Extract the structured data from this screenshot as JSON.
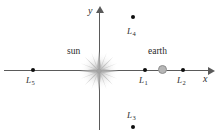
{
  "figure": {
    "type": "diagram",
    "background_color": "#ffffff"
  },
  "axes": {
    "x": {
      "label": "x",
      "orientation": "horizontal",
      "arrow": "right",
      "color": "#5a5a5a"
    },
    "y": {
      "label": "y",
      "orientation": "vertical",
      "arrow": "up",
      "color": "#5a5a5a"
    },
    "origin": {
      "x": 99,
      "y": 70
    }
  },
  "bodies": [
    {
      "name": "sun",
      "label": "sun",
      "icon": "sun-starburst-icon",
      "color": "#b9b9b9",
      "x": 99,
      "y": 70,
      "label_x": 67,
      "label_y": 47
    },
    {
      "name": "earth",
      "label": "earth",
      "icon": "earth-disc-icon",
      "color": "#b6b6b6",
      "x": 163,
      "y": 70,
      "label_x": 148,
      "label_y": 47
    }
  ],
  "lagrange_points": [
    {
      "id": "L1",
      "letter": "L",
      "subscript": "1",
      "x": 145,
      "y": 70,
      "label_x": 139,
      "label_y": 76,
      "color": "#0d0d0d"
    },
    {
      "id": "L2",
      "letter": "L",
      "subscript": "2",
      "x": 183,
      "y": 70,
      "label_x": 177,
      "label_y": 76,
      "color": "#0d0d0d"
    },
    {
      "id": "L3",
      "letter": "L",
      "subscript": "3",
      "x": 133,
      "y": 127,
      "label_x": 127,
      "label_y": 111,
      "color": "#0d0d0d"
    },
    {
      "id": "L4",
      "letter": "L",
      "subscript": "4",
      "x": 133,
      "y": 17,
      "label_x": 127,
      "label_y": 27,
      "color": "#0d0d0d"
    },
    {
      "id": "L5",
      "letter": "L",
      "subscript": "5",
      "x": 33,
      "y": 70,
      "label_x": 26,
      "label_y": 76,
      "color": "#0d0d0d"
    }
  ]
}
